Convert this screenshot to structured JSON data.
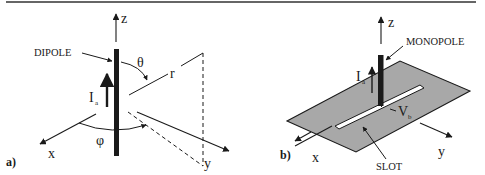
{
  "figure": {
    "colors": {
      "ink": "#1a1a1a",
      "ground_plane": "#a8a8a8",
      "slot": "#ffffff",
      "rule": "#333333"
    },
    "panel_a": {
      "label": "a)",
      "element_label": "DIPOLE",
      "current_symbol": "I",
      "current_subscript": "a",
      "axes": {
        "x": "x",
        "y": "y",
        "z": "z"
      },
      "theta": "θ",
      "phi": "φ",
      "radius": "r"
    },
    "panel_b": {
      "label": "b)",
      "element_label": "MONOPOLE",
      "slot_label": "SLOT",
      "current_symbol": "I",
      "current_subscript": "a",
      "voltage_symbol": "V",
      "voltage_subscript": "b",
      "axes": {
        "x": "x",
        "y": "y",
        "z": "z"
      }
    }
  }
}
